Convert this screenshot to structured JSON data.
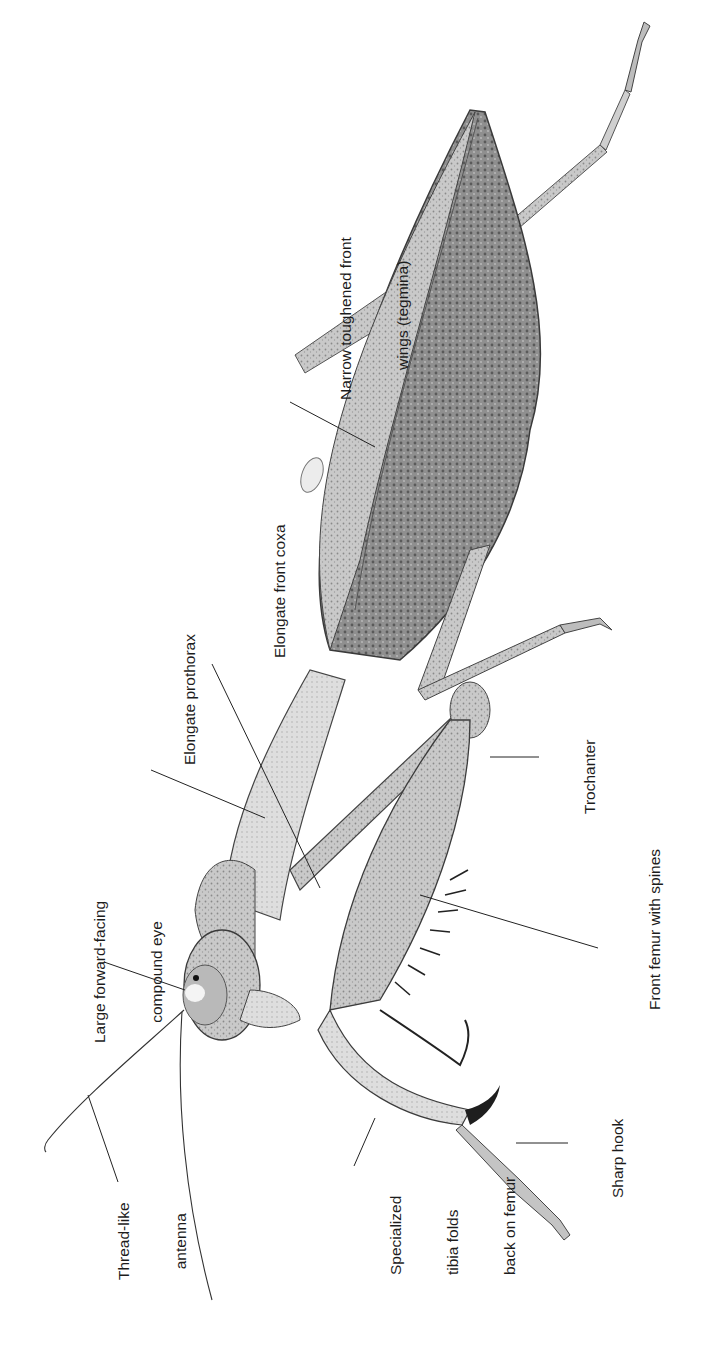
{
  "figure": {
    "orientation": "rotated 90° counter-clockwise",
    "colors": {
      "background": "#ffffff",
      "ink": "#1c1c1c",
      "body_light": "#d8d8d8",
      "body_mid": "#a9a9a9",
      "body_dark": "#6b6b6b"
    }
  },
  "labels": {
    "tegmina": {
      "lines": [
        "Narrow toughened front",
        "wings (tegmina)"
      ]
    },
    "coxa": {
      "lines": [
        "Elongate front coxa"
      ]
    },
    "prothorax": {
      "lines": [
        "Elongate prothorax"
      ]
    },
    "trochanter": {
      "lines": [
        "Trochanter"
      ]
    },
    "femur": {
      "lines": [
        "Front femur with spines"
      ]
    },
    "eye": {
      "lines": [
        "Large forward-facing",
        "compound eye"
      ]
    },
    "hook": {
      "lines": [
        "Sharp hook"
      ]
    },
    "tibia": {
      "lines": [
        "Specialized",
        "tibia folds",
        "back on femur"
      ]
    },
    "antenna": {
      "lines": [
        "Thread-like",
        "antenna"
      ]
    }
  }
}
